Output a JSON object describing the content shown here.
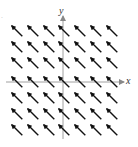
{
  "chart_data": {
    "type": "vector_field",
    "title": "",
    "xlabel": "x",
    "ylabel": "y",
    "vector": [
      -1,
      1
    ],
    "grid": {
      "cols": 7,
      "rows": 7
    },
    "x_positions_px": [
      17,
      33,
      49,
      64,
      80,
      96,
      112
    ],
    "y_positions_px": [
      31,
      47,
      63,
      82,
      98,
      114,
      130
    ],
    "axis_origin_px": {
      "x": 63,
      "y": 82
    },
    "arrow_color": "#111111",
    "axis_color": "#888888"
  },
  "labels": {
    "x": "x",
    "y": "y",
    "corner": "."
  }
}
